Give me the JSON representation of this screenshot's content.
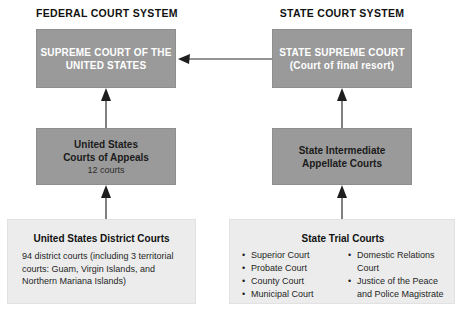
{
  "diagram": {
    "title_federal": "FEDERAL COURT SYSTEM",
    "title_state": "STATE COURT SYSTEM",
    "colors": {
      "box_dark": "#9a9a9a",
      "box_light": "#ececec",
      "text_light": "#ffffff",
      "text_dark": "#111111",
      "arrow": "#2b2b2b",
      "background": "#ffffff"
    },
    "federal": {
      "supreme": {
        "line1": "SUPREME COURT OF THE",
        "line2": "UNITED STATES"
      },
      "appeals": {
        "line1": "United States",
        "line2": "Courts of Appeals",
        "line3": "12 courts"
      },
      "district": {
        "title": "United States District Courts",
        "body": "94 district courts (including 3 territorial courts: Guam, Virgin Islands, and Northern Mariana Islands)"
      }
    },
    "state": {
      "supreme": {
        "line1": "STATE SUPREME COURT",
        "line2": "(Court of final resort)"
      },
      "appellate": {
        "line1": "State Intermediate",
        "line2": "Appellate Courts"
      },
      "trial": {
        "title": "State Trial Courts",
        "column_left": [
          "Superior Court",
          "Probate Court",
          "County Court",
          "Municipal Court"
        ],
        "column_right": [
          "Domestic Relations",
          "Justice of the Peace"
        ],
        "column_right_continuations": [
          "Court",
          "and Police Magistrate"
        ]
      }
    },
    "arrows": {
      "federal_district_to_appeals": "arrow-up-icon",
      "federal_appeals_to_supreme": "arrow-up-icon",
      "state_trial_to_appellate": "arrow-up-icon",
      "state_appellate_to_supreme": "arrow-up-icon",
      "state_supreme_to_federal_supreme": "arrow-left-icon"
    }
  }
}
